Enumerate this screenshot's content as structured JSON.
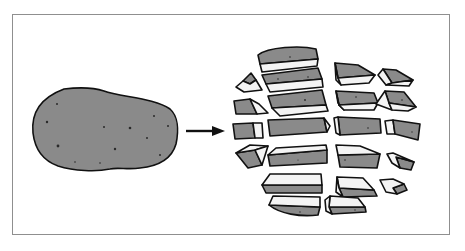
{
  "figure": {
    "left_item": "whole-potato",
    "transition": "arrow-right",
    "right_item": "potato-pieces",
    "colors": {
      "frame_border": "#8f8f8f",
      "potato_skin": "#8a8a8a",
      "cut_face": "#f4f4f4",
      "outline": "#111111"
    }
  }
}
